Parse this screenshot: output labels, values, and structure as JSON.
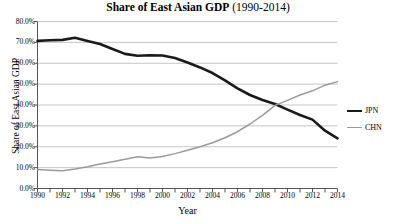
{
  "chart_data": {
    "type": "line",
    "title": "Share of East Asian GDP (1990-2014)",
    "title_main": "Share of East Asian GDP",
    "title_sub": "(1990-2014)",
    "xlabel": "Year",
    "ylabel": "Share of East Asian GDP",
    "xlim": [
      1990,
      2014
    ],
    "ylim": [
      0,
      0.8
    ],
    "grid": true,
    "grid_axis": "y",
    "legend_position": "right",
    "x": [
      1990,
      1991,
      1992,
      1993,
      1994,
      1995,
      1996,
      1997,
      1998,
      1999,
      2000,
      2001,
      2002,
      2003,
      2004,
      2005,
      2006,
      2007,
      2008,
      2009,
      2010,
      2011,
      2012,
      2013,
      2014
    ],
    "x_tick_labels": [
      "1990",
      "1992",
      "1994",
      "1996",
      "1998",
      "2000",
      "2002",
      "2004",
      "2006",
      "2008",
      "2010",
      "2012",
      "2014"
    ],
    "x_tick_values": [
      1990,
      1992,
      1994,
      1996,
      1998,
      2000,
      2002,
      2004,
      2006,
      2008,
      2010,
      2012,
      2014
    ],
    "y_tick_labels": [
      "0.0%",
      "10.0%",
      "20.0%",
      "30.0%",
      "40.0%",
      "50.0%",
      "60.0%",
      "70.0%",
      "80.0%"
    ],
    "y_tick_values": [
      0,
      0.1,
      0.2,
      0.3,
      0.4,
      0.5,
      0.6,
      0.7,
      0.8
    ],
    "series": [
      {
        "name": "JPN",
        "color": "#1a1a1a",
        "width": 2.6,
        "values": [
          0.707,
          0.71,
          0.712,
          0.722,
          0.707,
          0.692,
          0.668,
          0.645,
          0.636,
          0.638,
          0.637,
          0.625,
          0.604,
          0.58,
          0.553,
          0.518,
          0.48,
          0.448,
          0.424,
          0.405,
          0.378,
          0.352,
          0.33,
          0.277,
          0.24
        ]
      },
      {
        "name": "CHN",
        "color": "#9a9a9a",
        "width": 1.5,
        "values": [
          0.091,
          0.088,
          0.085,
          0.093,
          0.104,
          0.117,
          0.128,
          0.14,
          0.152,
          0.146,
          0.153,
          0.167,
          0.183,
          0.2,
          0.219,
          0.243,
          0.272,
          0.309,
          0.35,
          0.398,
          0.422,
          0.448,
          0.468,
          0.495,
          0.512
        ]
      }
    ]
  },
  "legend": {
    "items": [
      {
        "label": "JPN",
        "color": "#1a1a1a",
        "width": 2.6
      },
      {
        "label": "CHN",
        "color": "#9a9a9a",
        "width": 1.5
      }
    ]
  },
  "footnote": ""
}
